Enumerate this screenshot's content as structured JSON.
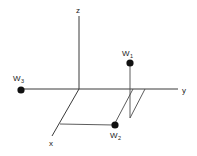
{
  "diagram": {
    "type": "3d-axes-with-point-masses",
    "axes": {
      "x_label": "x",
      "y_label": "y",
      "z_label": "z"
    },
    "points": [
      {
        "name": "W",
        "subscript": "1"
      },
      {
        "name": "W",
        "subscript": "2"
      },
      {
        "name": "W",
        "subscript": "3"
      }
    ],
    "colors": {
      "lines": "#3a3a3a",
      "points": "#111111",
      "background": "#ffffff"
    }
  }
}
